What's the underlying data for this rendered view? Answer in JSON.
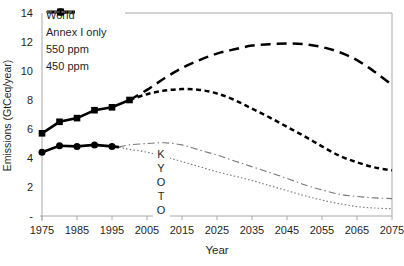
{
  "figure": {
    "x_axis_title": "Year",
    "y_axis_title": "Emissions (GtCeq/year)"
  },
  "legend": {
    "position": "top-left",
    "items": [
      {
        "label": "World",
        "style": "thick-solid-square-marker"
      },
      {
        "label": "Annex I only",
        "style": "thick-solid-circle-marker"
      },
      {
        "label": "550 ppm",
        "style": "thin-dashed"
      },
      {
        "label": "450 ppm",
        "style": "thin-dotted"
      }
    ]
  },
  "annotation": {
    "text": "KYOTO",
    "orientation": "vertical",
    "x_year": 2009
  },
  "colors": {
    "curve_black": "#000000",
    "scenario_grey": "#787878",
    "axis": "#a8a8a8",
    "text": "#1f1f1f",
    "kyoto_text": "#4d4d4d",
    "background": "#ffffff"
  },
  "chart_data": {
    "type": "line",
    "title": "",
    "xlabel": "Year",
    "ylabel": "Emissions (GtCeq/year)",
    "xlim": [
      1975,
      2075
    ],
    "ylim": [
      0,
      14
    ],
    "grid": false,
    "legend_position": "top-left",
    "x_ticks": [
      1975,
      1985,
      1995,
      2005,
      2015,
      2025,
      2035,
      2045,
      2055,
      2065,
      2075
    ],
    "y_ticks": [
      {
        "label": "14",
        "value": 14
      },
      {
        "label": "12",
        "value": 12
      },
      {
        "label": "10",
        "value": 10
      },
      {
        "label": "8",
        "value": 8
      },
      {
        "label": "6",
        "value": 6
      },
      {
        "label": "4",
        "value": 4
      },
      {
        "label": "2",
        "value": 2
      },
      {
        "label": "-",
        "value": 0
      }
    ],
    "series": [
      {
        "id": "world_observed",
        "name": "World (observed)",
        "stroke": "#000000",
        "width": 2.6,
        "dash": "",
        "marker": "square",
        "smooth": false,
        "points": [
          [
            1975,
            5.7
          ],
          [
            1980,
            6.5
          ],
          [
            1985,
            6.75
          ],
          [
            1990,
            7.3
          ],
          [
            1995,
            7.5
          ],
          [
            2000,
            8.0
          ]
        ]
      },
      {
        "id": "annex1_observed",
        "name": "Annex I only (observed)",
        "stroke": "#000000",
        "width": 2.6,
        "dash": "",
        "marker": "circle",
        "smooth": false,
        "points": [
          [
            1975,
            4.4
          ],
          [
            1980,
            4.85
          ],
          [
            1985,
            4.8
          ],
          [
            1990,
            4.9
          ],
          [
            1995,
            4.8
          ],
          [
            1997,
            4.75
          ]
        ]
      },
      {
        "id": "world_550",
        "name": "World, 550 ppm pathway",
        "stroke": "#000000",
        "width": 2.5,
        "dash": "10 6",
        "marker": "none",
        "smooth": true,
        "points": [
          [
            2000,
            8.0
          ],
          [
            2005,
            8.7
          ],
          [
            2010,
            9.5
          ],
          [
            2015,
            10.2
          ],
          [
            2020,
            10.75
          ],
          [
            2025,
            11.2
          ],
          [
            2030,
            11.5
          ],
          [
            2035,
            11.75
          ],
          [
            2040,
            11.85
          ],
          [
            2045,
            11.9
          ],
          [
            2050,
            11.85
          ],
          [
            2055,
            11.65
          ],
          [
            2060,
            11.3
          ],
          [
            2065,
            10.75
          ],
          [
            2070,
            9.95
          ],
          [
            2075,
            9.05
          ]
        ]
      },
      {
        "id": "world_450",
        "name": "World, 450 ppm pathway",
        "stroke": "#000000",
        "width": 2.5,
        "dash": "5 3.5",
        "marker": "none",
        "smooth": true,
        "points": [
          [
            2000,
            8.0
          ],
          [
            2005,
            8.4
          ],
          [
            2010,
            8.65
          ],
          [
            2015,
            8.75
          ],
          [
            2020,
            8.7
          ],
          [
            2025,
            8.45
          ],
          [
            2030,
            8.0
          ],
          [
            2035,
            7.4
          ],
          [
            2040,
            6.8
          ],
          [
            2045,
            6.15
          ],
          [
            2050,
            5.5
          ],
          [
            2055,
            4.8
          ],
          [
            2060,
            4.15
          ],
          [
            2065,
            3.7
          ],
          [
            2070,
            3.35
          ],
          [
            2075,
            3.15
          ]
        ]
      },
      {
        "id": "annex1_550",
        "name": "Annex I, 550 ppm pathway",
        "stroke": "#787878",
        "width": 1.1,
        "dash": "7 3 1.5 3",
        "marker": "none",
        "smooth": true,
        "points": [
          [
            1997,
            4.75
          ],
          [
            2000,
            4.9
          ],
          [
            2005,
            5.0
          ],
          [
            2010,
            5.05
          ],
          [
            2015,
            4.9
          ],
          [
            2020,
            4.55
          ],
          [
            2025,
            4.2
          ],
          [
            2030,
            3.8
          ],
          [
            2035,
            3.4
          ],
          [
            2040,
            3.0
          ],
          [
            2045,
            2.6
          ],
          [
            2050,
            2.15
          ],
          [
            2055,
            1.8
          ],
          [
            2060,
            1.5
          ],
          [
            2065,
            1.35
          ],
          [
            2070,
            1.25
          ],
          [
            2075,
            1.2
          ]
        ]
      },
      {
        "id": "annex1_450",
        "name": "Annex I, 450 ppm pathway",
        "stroke": "#787878",
        "width": 1.1,
        "dash": "1.5 2.2",
        "marker": "none",
        "smooth": true,
        "points": [
          [
            1997,
            4.75
          ],
          [
            2000,
            4.6
          ],
          [
            2005,
            4.4
          ],
          [
            2010,
            4.1
          ],
          [
            2015,
            3.75
          ],
          [
            2020,
            3.4
          ],
          [
            2025,
            3.05
          ],
          [
            2030,
            2.75
          ],
          [
            2035,
            2.45
          ],
          [
            2040,
            2.1
          ],
          [
            2045,
            1.75
          ],
          [
            2050,
            1.4
          ],
          [
            2055,
            1.1
          ],
          [
            2060,
            0.85
          ],
          [
            2065,
            0.65
          ],
          [
            2070,
            0.55
          ],
          [
            2075,
            0.5
          ]
        ]
      }
    ]
  }
}
